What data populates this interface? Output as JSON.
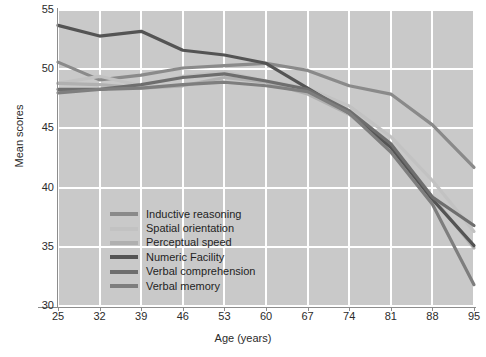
{
  "chart_data": {
    "type": "line",
    "title": "",
    "xlabel": "Age (years)",
    "ylabel": "Mean scores",
    "x": [
      25,
      32,
      39,
      46,
      53,
      60,
      67,
      74,
      81,
      88,
      95
    ],
    "xtick_labels": [
      "25",
      "32",
      "39",
      "46",
      "53",
      "60",
      "67",
      "74",
      "81",
      "88",
      "95"
    ],
    "ytick_labels": [
      "30",
      "35",
      "40",
      "45",
      "50",
      "55"
    ],
    "yticks": [
      30,
      35,
      40,
      45,
      50,
      55
    ],
    "xlim": [
      25,
      95
    ],
    "ylim": [
      30,
      55
    ],
    "grid": true,
    "legend_position": "inside-lower-left",
    "series": [
      {
        "name": "Inductive reasoning",
        "color": "#8a8a8a",
        "values": [
          50.6,
          49.1,
          49.5,
          50.1,
          50.3,
          50.5,
          49.9,
          48.6,
          47.9,
          45.3,
          41.7
        ]
      },
      {
        "name": "Spatial orientation",
        "color": "#c2c2c2",
        "values": [
          48.8,
          49.4,
          48.6,
          49.4,
          49.8,
          49.0,
          48.4,
          46.9,
          44.3,
          40.6,
          36.3
        ]
      },
      {
        "name": "Perceptual speed",
        "color": "#b0b0b0",
        "values": [
          48.8,
          48.7,
          48.4,
          48.6,
          49.3,
          48.9,
          47.9,
          46.2,
          43.3,
          39.2,
          34.9
        ]
      },
      {
        "name": "Numeric Facility",
        "color": "#545454",
        "values": [
          53.7,
          52.8,
          53.2,
          51.6,
          51.2,
          50.5,
          48.4,
          46.3,
          43.4,
          39.0,
          35.1
        ]
      },
      {
        "name": "Verbal comprehension",
        "color": "#6e6e6e",
        "values": [
          48.3,
          48.3,
          48.7,
          49.3,
          49.6,
          49.0,
          48.3,
          46.5,
          43.7,
          39.2,
          36.8
        ]
      },
      {
        "name": "Verbal memory",
        "color": "#7e7e7e",
        "values": [
          48.0,
          48.3,
          48.4,
          48.7,
          48.9,
          48.6,
          48.1,
          46.3,
          43.0,
          38.6,
          31.8
        ]
      }
    ]
  },
  "legend": {
    "items": [
      {
        "label": "Inductive reasoning"
      },
      {
        "label": "Spatial orientation"
      },
      {
        "label": "Perceptual speed"
      },
      {
        "label": "Numeric Facility"
      },
      {
        "label": "Verbal comprehension"
      },
      {
        "label": "Verbal memory"
      }
    ]
  },
  "colors": {
    "plot_background": "#c9c9c9",
    "page_background": "#ffffff",
    "gridline": "#ffffff",
    "axis": "#8d8d8d",
    "text": "#2b2b2b"
  }
}
